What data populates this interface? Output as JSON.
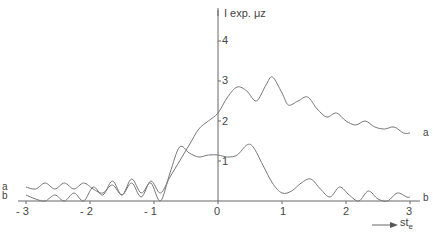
{
  "chart_data": {
    "type": "line",
    "title": "",
    "xlabel": "st_e",
    "ylabel": "I exp. μz",
    "xlim": [
      -3,
      3
    ],
    "ylim": [
      0,
      4.3
    ],
    "grid": false,
    "legend": "inline curve labels at ends",
    "x_ticks": [
      "-3",
      "-2",
      "-1",
      "0",
      "1",
      "2",
      "3"
    ],
    "y_ticks": [
      "1",
      "2",
      "3",
      "4"
    ],
    "series": [
      {
        "name": "a",
        "x": [
          -3.0,
          -2.85,
          -2.7,
          -2.55,
          -2.4,
          -2.25,
          -2.1,
          -1.95,
          -1.8,
          -1.65,
          -1.5,
          -1.35,
          -1.2,
          -1.05,
          -0.9,
          -0.75,
          -0.6,
          -0.45,
          -0.3,
          -0.15,
          0.0,
          0.15,
          0.3,
          0.45,
          0.6,
          0.75,
          0.85,
          1.0,
          1.1,
          1.25,
          1.4,
          1.55,
          1.7,
          1.85,
          2.0,
          2.15,
          2.3,
          2.45,
          2.6,
          2.75,
          2.9,
          3.0
        ],
        "y": [
          0.35,
          0.3,
          0.45,
          0.3,
          0.45,
          0.3,
          0.45,
          0.3,
          0.2,
          0.4,
          0.15,
          0.45,
          0.1,
          0.5,
          0.2,
          0.6,
          1.0,
          1.4,
          1.8,
          2.0,
          2.2,
          2.6,
          2.85,
          2.75,
          2.5,
          2.9,
          3.1,
          2.7,
          2.4,
          2.5,
          2.6,
          2.3,
          2.1,
          2.2,
          2.0,
          1.9,
          2.0,
          1.85,
          1.8,
          1.85,
          1.7,
          1.7
        ]
      },
      {
        "name": "b",
        "x": [
          -3.0,
          -2.85,
          -2.7,
          -2.55,
          -2.4,
          -2.25,
          -2.1,
          -1.95,
          -1.8,
          -1.65,
          -1.5,
          -1.35,
          -1.2,
          -1.05,
          -0.9,
          -0.75,
          -0.6,
          -0.45,
          -0.3,
          -0.15,
          0.0,
          0.15,
          0.3,
          0.45,
          0.55,
          0.7,
          0.85,
          1.0,
          1.15,
          1.3,
          1.45,
          1.6,
          1.75,
          1.9,
          2.05,
          2.2,
          2.35,
          2.5,
          2.65,
          2.8,
          2.95,
          3.0
        ],
        "y": [
          0.15,
          0.05,
          0.0,
          0.15,
          0.0,
          0.2,
          0.0,
          0.35,
          0.15,
          0.5,
          0.15,
          0.55,
          0.2,
          0.45,
          0.0,
          0.7,
          1.35,
          1.2,
          1.1,
          1.15,
          1.15,
          1.1,
          1.15,
          1.4,
          1.35,
          0.9,
          0.45,
          0.2,
          0.25,
          0.45,
          0.55,
          0.3,
          0.1,
          0.35,
          0.15,
          0.0,
          0.25,
          0.05,
          0.0,
          0.2,
          0.1,
          0.1
        ]
      }
    ],
    "annotations": [
      "a",
      "b"
    ]
  },
  "axes": {
    "y_label": "I exp. μz",
    "x_label_main": "st",
    "x_label_sub": "e",
    "x_ticks": [
      "- 3",
      "- 2",
      "- 1",
      "0",
      "1",
      "2",
      "3"
    ],
    "y_ticks": [
      "1",
      "2",
      "3",
      "4"
    ]
  },
  "labels": {
    "curve_a": "a",
    "curve_b": "b"
  }
}
